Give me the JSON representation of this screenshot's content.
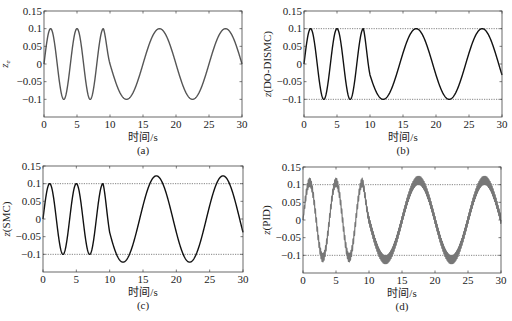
{
  "figure": {
    "background": "#ffffff",
    "panels": [
      {
        "id": "a",
        "caption": "(a)",
        "ylabel": "z_e",
        "ylabel_main": "z",
        "ylabel_sub": "e",
        "xlabel": "时间/s",
        "box": {
          "x0": 44,
          "y0": 11,
          "x1": 242,
          "y1": 117
        },
        "line_color": "#555555",
        "line_width": 1.4,
        "dotted_bounds": false,
        "signal": "ref",
        "amp_late": 0.1,
        "chatter": 0
      },
      {
        "id": "b",
        "caption": "(b)",
        "ylabel": "z(DO-DISMC)",
        "xlabel": "时间/s",
        "box": {
          "x0": 304,
          "y0": 11,
          "x1": 502,
          "y1": 117
        },
        "line_color": "#111111",
        "line_width": 1.4,
        "dotted_bounds": true,
        "signal": "ref",
        "amp_late": 0.1,
        "chatter": 0
      },
      {
        "id": "c",
        "caption": "(c)",
        "ylabel": "z(SMC)",
        "xlabel": "时间/s",
        "box": {
          "x0": 43,
          "y0": 166,
          "x1": 243,
          "y1": 272
        },
        "line_color": "#111111",
        "line_width": 1.4,
        "dotted_bounds": true,
        "signal": "ref",
        "amp_late": 0.122,
        "chatter": 0
      },
      {
        "id": "d",
        "caption": "(d)",
        "ylabel": "z(PID)",
        "xlabel": "时间/s",
        "box": {
          "x0": 303,
          "y0": 167,
          "x1": 501,
          "y1": 273
        },
        "line_color": "#777777",
        "line_width": 1.2,
        "dotted_bounds": true,
        "signal": "ref",
        "amp_late": 0.105,
        "chatter": 0.012
      }
    ]
  },
  "chart_data": [
    {
      "type": "line",
      "panel": "(a)",
      "title": "",
      "xlabel": "时间/s",
      "ylabel": "z_e",
      "xlim": [
        0,
        30
      ],
      "ylim": [
        -0.15,
        0.15
      ],
      "xticks": [
        0,
        5,
        10,
        15,
        20,
        25,
        30
      ],
      "yticks": [
        -0.1,
        -0.05,
        0,
        0.05,
        0.1,
        0.15
      ],
      "ytick_labels": [
        "-0.1",
        "-0.05",
        "0",
        "0.05",
        "0.1",
        "0.15"
      ],
      "grid": false,
      "reference_lines": [],
      "series": [
        {
          "name": "z_e",
          "color": "#555555",
          "x": [
            0,
            1,
            3,
            5,
            7,
            9,
            10,
            12.5,
            17.5,
            22.5,
            27.5,
            30
          ],
          "y": [
            0,
            0.1,
            -0.1,
            0.1,
            -0.1,
            0.1,
            0,
            -0.1,
            0.1,
            -0.1,
            0.1,
            0
          ]
        }
      ]
    },
    {
      "type": "line",
      "panel": "(b)",
      "title": "",
      "xlabel": "时间/s",
      "ylabel": "z(DO-DISMC)",
      "xlim": [
        0,
        30
      ],
      "ylim": [
        -0.15,
        0.15
      ],
      "xticks": [
        0,
        5,
        10,
        15,
        20,
        25,
        30
      ],
      "yticks": [
        -0.1,
        -0.05,
        0,
        0.05,
        0.1,
        0.15
      ],
      "ytick_labels": [
        "-0.1",
        "-0.05",
        "0",
        "0.05",
        "0.1",
        "0.15"
      ],
      "grid": false,
      "reference_lines": [
        0.1,
        -0.1
      ],
      "series": [
        {
          "name": "z(DO-DISMC)",
          "color": "#111111",
          "x": [
            0,
            1,
            3,
            5,
            7,
            9,
            12,
            17,
            22,
            27,
            30
          ],
          "y": [
            0,
            0.1,
            -0.1,
            0.1,
            -0.1,
            0.1,
            -0.1,
            0.1,
            -0.1,
            0.1,
            -0.03
          ]
        }
      ]
    },
    {
      "type": "line",
      "panel": "(c)",
      "title": "",
      "xlabel": "时间/s",
      "ylabel": "z(SMC)",
      "xlim": [
        0,
        30
      ],
      "ylim": [
        -0.15,
        0.15
      ],
      "xticks": [
        0,
        5,
        10,
        15,
        20,
        25,
        30
      ],
      "yticks": [
        -0.1,
        -0.05,
        0,
        0.05,
        0.1,
        0.15
      ],
      "ytick_labels": [
        "-0.1",
        "-0.05",
        "0",
        "0.05",
        "0.1",
        "0.15"
      ],
      "grid": false,
      "reference_lines": [
        0.1,
        -0.1
      ],
      "series": [
        {
          "name": "z(SMC)",
          "color": "#111111",
          "x": [
            0,
            1,
            3,
            5,
            7,
            9,
            12,
            17,
            22,
            27,
            30
          ],
          "y": [
            0,
            0.1,
            -0.1,
            0.1,
            -0.1,
            0.1,
            -0.122,
            0.122,
            -0.122,
            0.122,
            -0.04
          ]
        }
      ]
    },
    {
      "type": "line",
      "panel": "(d)",
      "title": "",
      "xlabel": "时间/s",
      "ylabel": "z(PID)",
      "xlim": [
        0,
        30
      ],
      "ylim": [
        -0.15,
        0.15
      ],
      "xticks": [
        0,
        5,
        10,
        15,
        20,
        25,
        30
      ],
      "yticks": [
        -0.1,
        -0.05,
        0,
        0.05,
        0.1,
        0.15
      ],
      "ytick_labels": [
        "-0.1",
        "-0.05",
        "0",
        "0.05",
        "0.1",
        "0.15"
      ],
      "grid": false,
      "reference_lines": [
        0.1,
        -0.1
      ],
      "series": [
        {
          "name": "z(PID)",
          "color": "#777777",
          "x": [
            0,
            1,
            3,
            5,
            7,
            9,
            12.5,
            17.5,
            22.5,
            27.5,
            30
          ],
          "y": [
            0,
            0.11,
            -0.115,
            0.11,
            -0.11,
            0.11,
            -0.118,
            0.118,
            -0.12,
            0.12,
            -0.01
          ],
          "note": "high-frequency chattering of amplitude ~0.01 superimposed"
        }
      ]
    }
  ]
}
